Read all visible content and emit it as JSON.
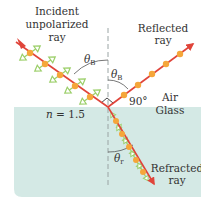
{
  "diagram": {
    "labels": {
      "incident": [
        "Incident",
        "unpolarized",
        "ray"
      ],
      "reflected": [
        "Reflected",
        "ray"
      ],
      "refracted": [
        "Refracted",
        "ray"
      ],
      "air": "Air",
      "glass": "Glass",
      "index": "n = 1.5",
      "index_symbol": "n",
      "index_value": "= 1.5",
      "angle_incident": "θ",
      "angle_incident_sub": "B",
      "angle_reflected": "θ",
      "angle_reflected_sub": "B",
      "angle_refracted": "θ",
      "angle_refracted_sub": "r",
      "right_angle": "90°"
    },
    "colors": {
      "glass": "#d4e9e5",
      "ray": "#e0443a",
      "dot": "#f5a63a",
      "polarization_arrow": "#9ccf6a",
      "normal": "#9aa4a4",
      "text": "#333333"
    }
  }
}
